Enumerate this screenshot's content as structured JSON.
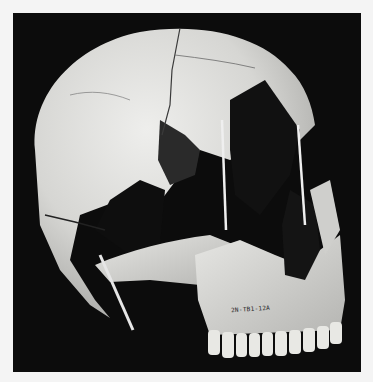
{
  "image": {
    "subject": "human skull, three-quarter lateral view",
    "background_color": "#0c0c0c",
    "border_color": "#f4f4f4",
    "bone_color": "#d9d9d6",
    "specimen_label": "2N-TB1-12A"
  }
}
